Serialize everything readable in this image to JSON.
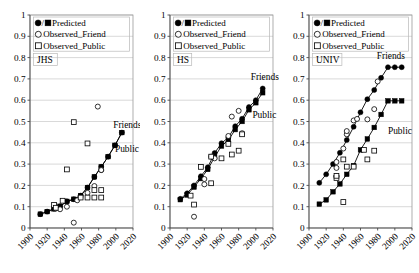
{
  "figure": {
    "title": "",
    "panel_count": 3
  },
  "legend": {
    "predicted_label": "Predicted",
    "predicted_prefix": "●/■",
    "observed_friend_label": "Observed_Friend",
    "observed_public_label": "Observed_Public",
    "friend_marker": "○",
    "public_marker": "□"
  },
  "axis": {
    "ylabel": "",
    "xlabel": "",
    "ylim": [
      0,
      1
    ],
    "xlim": [
      1900,
      2020
    ],
    "yticks": [
      "0",
      "0.1",
      "0.2",
      "0.3",
      "0.4",
      "0.5",
      "0.6",
      "0.7",
      "0.8",
      "0.9",
      "1"
    ],
    "ytick_values": [
      0,
      0.1,
      0.2,
      0.3,
      0.4,
      0.5,
      0.6,
      0.7,
      0.8,
      0.9,
      1
    ],
    "xticks": [
      "1900",
      "1920",
      "1940",
      "1960",
      "1980",
      "2000",
      "2020"
    ],
    "xtick_values": [
      1900,
      1920,
      1940,
      1960,
      1980,
      2000,
      2020
    ],
    "grid": true
  },
  "colors": {
    "marker": "#000000",
    "line": "#000000",
    "grid": "#c9c9c9",
    "frame": "#9a9a9a",
    "background": "#ffffff"
  },
  "chart_data": [
    {
      "type": "scatter",
      "panel": "JHS",
      "group_label": "JHS",
      "title": "",
      "xlabel": "",
      "ylabel": "",
      "xlim": [
        1900,
        2020
      ],
      "ylim": [
        0,
        1
      ],
      "grid": true,
      "legend_position": "top-left",
      "annotations": [
        {
          "text": "Friends",
          "x": 1997,
          "y": 0.47
        },
        {
          "text": "Public",
          "x": 1999,
          "y": 0.355
        }
      ],
      "series": [
        {
          "name": "Predicted_Friends",
          "marker": "filled-circle",
          "line": true,
          "x": [
            1912,
            1920,
            1928,
            1935,
            1943,
            1951,
            1959,
            1967,
            1975,
            1983,
            1991,
            1999,
            2007
          ],
          "y": [
            0.065,
            0.077,
            0.09,
            0.102,
            0.125,
            0.135,
            0.152,
            0.19,
            0.24,
            0.287,
            0.335,
            0.388,
            0.448
          ]
        },
        {
          "name": "Predicted_Public",
          "marker": "filled-square",
          "line": true,
          "x": [
            1912,
            1920,
            1928,
            1935,
            1943,
            1951,
            1959,
            1967,
            1975,
            1983,
            1991,
            1999,
            2007
          ],
          "y": [
            0.065,
            0.077,
            0.09,
            0.102,
            0.125,
            0.135,
            0.152,
            0.19,
            0.24,
            0.287,
            0.335,
            0.388,
            0.448
          ]
        },
        {
          "name": "Observed_Friend",
          "marker": "open-circle",
          "line": false,
          "x": [
            1930,
            1935,
            1943,
            1951,
            1955,
            1967,
            1975,
            1979,
            1983,
            1983
          ],
          "y": [
            0.092,
            0.088,
            0.1,
            0.025,
            0.13,
            0.165,
            0.197,
            0.57,
            0.272,
            0.272
          ]
        },
        {
          "name": "Observed_Public",
          "marker": "open-square",
          "line": false,
          "x": [
            1928,
            1930,
            1938,
            1943,
            1951,
            1959,
            1967,
            1967,
            1975,
            1975,
            1983,
            1983
          ],
          "y": [
            0.108,
            0.095,
            0.128,
            0.275,
            0.497,
            0.143,
            0.397,
            0.143,
            0.143,
            0.178,
            0.143,
            0.178
          ]
        }
      ]
    },
    {
      "type": "scatter",
      "panel": "HS",
      "group_label": "HS",
      "title": "",
      "xlabel": "",
      "ylabel": "",
      "xlim": [
        1900,
        2020
      ],
      "ylim": [
        0,
        1
      ],
      "grid": true,
      "legend_position": "top-left",
      "annotations": [
        {
          "text": "Friends",
          "x": 1994,
          "y": 0.695
        },
        {
          "text": "Public",
          "x": 1996,
          "y": 0.515
        }
      ],
      "series": [
        {
          "name": "Predicted_Friends",
          "marker": "filled-circle",
          "line": true,
          "x": [
            1912,
            1920,
            1928,
            1936,
            1944,
            1952,
            1960,
            1968,
            1976,
            1984,
            1992,
            2000,
            2008
          ],
          "y": [
            0.137,
            0.163,
            0.2,
            0.243,
            0.285,
            0.352,
            0.398,
            0.425,
            0.478,
            0.513,
            0.568,
            0.6,
            0.655
          ]
        },
        {
          "name": "Predicted_Public",
          "marker": "filled-square",
          "line": true,
          "x": [
            1912,
            1920,
            1928,
            1936,
            1944,
            1952,
            1960,
            1968,
            1976,
            1984,
            1992,
            2000,
            2008
          ],
          "y": [
            0.133,
            0.155,
            0.192,
            0.232,
            0.275,
            0.333,
            0.385,
            0.412,
            0.462,
            0.5,
            0.555,
            0.588,
            0.635
          ]
        },
        {
          "name": "Observed_Friend",
          "marker": "open-circle",
          "line": false,
          "x": [
            1928,
            1940,
            1940,
            1948,
            1952,
            1968,
            1972,
            1980,
            1984
          ],
          "y": [
            0.053,
            0.205,
            0.23,
            0.335,
            0.327,
            0.432,
            0.523,
            0.55,
            0.445
          ]
        },
        {
          "name": "Observed_Public",
          "marker": "open-square",
          "line": false,
          "x": [
            1924,
            1928,
            1936,
            1948,
            1948,
            1960,
            1968,
            1972,
            1980,
            1984
          ],
          "y": [
            0.152,
            0.11,
            0.287,
            0.335,
            0.21,
            0.327,
            0.395,
            0.345,
            0.363,
            0.44
          ]
        }
      ]
    },
    {
      "type": "scatter",
      "panel": "UNIV",
      "group_label": "UNIV",
      "title": "",
      "xlabel": "",
      "ylabel": "",
      "xlim": [
        1900,
        2020
      ],
      "ylim": [
        0,
        1
      ],
      "grid": true,
      "legend_position": "top-left",
      "annotations": [
        {
          "text": "Friends",
          "x": 1979,
          "y": 0.795
        },
        {
          "text": "Public",
          "x": 1992,
          "y": 0.44
        }
      ],
      "series": [
        {
          "name": "Predicted_Friends",
          "marker": "filled-circle",
          "line": true,
          "x": [
            1912,
            1920,
            1928,
            1936,
            1944,
            1952,
            1960,
            1968,
            1976,
            1984,
            1992,
            2000,
            2008
          ],
          "y": [
            0.212,
            0.252,
            0.3,
            0.353,
            0.413,
            0.475,
            0.543,
            0.605,
            0.648,
            0.705,
            0.755,
            0.755,
            0.755
          ]
        },
        {
          "name": "Predicted_Public",
          "marker": "filled-square",
          "line": true,
          "x": [
            1912,
            1920,
            1928,
            1936,
            1944,
            1952,
            1960,
            1968,
            1976,
            1984,
            1992,
            2000,
            2008
          ],
          "y": [
            0.112,
            0.132,
            0.17,
            0.207,
            0.252,
            0.293,
            0.367,
            0.418,
            0.472,
            0.533,
            0.597,
            0.597,
            0.597
          ]
        },
        {
          "name": "Observed_Friend",
          "marker": "open-circle",
          "line": false,
          "x": [
            1932,
            1932,
            1932,
            1940,
            1944,
            1944,
            1952,
            1956,
            1968,
            1976,
            1980
          ],
          "y": [
            0.243,
            0.282,
            0.31,
            0.373,
            0.44,
            0.455,
            0.505,
            0.512,
            0.51,
            0.558,
            0.688
          ]
        },
        {
          "name": "Observed_Public",
          "marker": "open-square",
          "line": false,
          "x": [
            1932,
            1932,
            1940,
            1940,
            1944,
            1952,
            1964,
            1968,
            1976
          ],
          "y": [
            0.235,
            0.245,
            0.122,
            0.322,
            0.288,
            0.288,
            0.367,
            0.322,
            0.363
          ]
        }
      ]
    }
  ]
}
